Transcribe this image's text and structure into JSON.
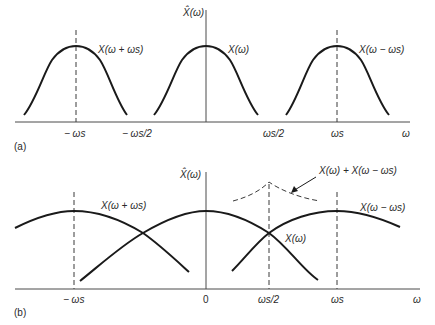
{
  "figure": {
    "colors": {
      "ink": "#1a1a1a",
      "axis": "#4a4a4a",
      "dashed": "#3a3a3a",
      "background": "#ffffff"
    }
  },
  "panel_a": {
    "tag": "(a)",
    "y_axis_label": "X̂(ω)",
    "x_axis_label": "ω",
    "ticks": [
      {
        "label": "− ωs",
        "position": "-ws"
      },
      {
        "label": "− ωs/2",
        "position": "-ws/2"
      },
      {
        "label": "ωs/2",
        "position": "ws/2"
      },
      {
        "label": "ωs",
        "position": "ws"
      }
    ],
    "curves": [
      {
        "label": "X(ω + ωs)",
        "center": "-ws"
      },
      {
        "label": "X(ω)",
        "center": "0"
      },
      {
        "label": "X(ω − ωs)",
        "center": "ws"
      }
    ]
  },
  "panel_b": {
    "tag": "(b)",
    "y_axis_label": "X̂(ω)",
    "x_axis_label": "ω",
    "ticks": [
      {
        "label": "− ωs",
        "position": "-ws"
      },
      {
        "label": "0",
        "position": "0"
      },
      {
        "label": "ωs/2",
        "position": "ws/2"
      },
      {
        "label": "ωs",
        "position": "ws"
      }
    ],
    "curves": [
      {
        "label": "X(ω + ωs)",
        "center": "-ws"
      },
      {
        "label": "X(ω)",
        "center": "0"
      },
      {
        "label": "X(ω − ωs)",
        "center": "ws"
      }
    ],
    "sum_annotation": "X(ω) + X(ω − ωs)"
  }
}
